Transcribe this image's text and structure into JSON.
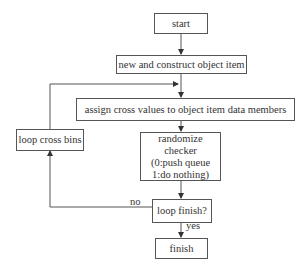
{
  "diagram": {
    "type": "flowchart",
    "nodes": {
      "start": "start",
      "construct": "new and construct object item",
      "assign": "assign cross values to object item data members",
      "loop_bins": "loop cross bins",
      "randomize_line1": "randomize checker",
      "randomize_line2": "(0:push queue",
      "randomize_line3": "1:do nothing)",
      "loop_finish": "loop finish?",
      "finish": "finish"
    },
    "edge_labels": {
      "no": "no",
      "yes": "yes"
    },
    "edges": [
      [
        "start",
        "construct"
      ],
      [
        "construct",
        "assign"
      ],
      [
        "assign",
        "randomize"
      ],
      [
        "randomize",
        "loop_finish"
      ],
      [
        "loop_finish",
        "finish",
        "yes"
      ],
      [
        "loop_finish",
        "loop_bins",
        "no"
      ],
      [
        "loop_bins",
        "assign"
      ]
    ]
  }
}
